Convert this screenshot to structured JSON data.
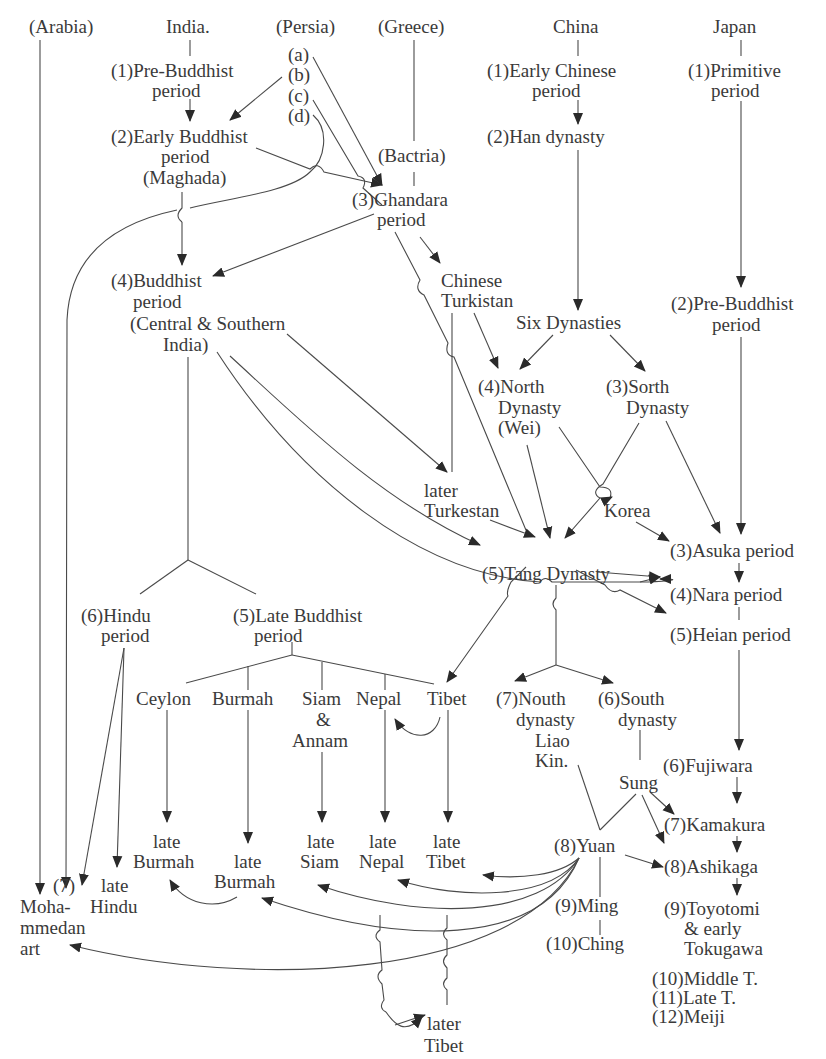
{
  "diagram": {
    "type": "genealogy-flowchart",
    "columns": {
      "arabia": "(Arabia)",
      "india": "India.",
      "persia": "(Persia)",
      "greece": "(Greece)",
      "china": "China",
      "japan": "Japan"
    },
    "persia_sub": [
      "(a)",
      "(b)",
      "(c)",
      "(d)"
    ],
    "bactria": "(Bactria)",
    "india": {
      "p1": [
        "(1)Pre-Buddhist",
        "period"
      ],
      "p2": [
        "(2)Early Buddhist",
        "period",
        "(Maghada)"
      ],
      "p3": [
        "(3)Ghandara",
        "period"
      ],
      "p4": [
        "(4)Buddhist",
        "period",
        "(Central & Southern",
        "India)"
      ],
      "p5": [
        "(5)Late Buddhist",
        "period"
      ],
      "p6": [
        "(6)Hindu",
        "period"
      ],
      "p7": [
        "(7)",
        "Moha-",
        "mmedan",
        "art"
      ],
      "late_hindu": [
        "late",
        "Hindu"
      ],
      "branches": {
        "ceylon": "Ceylon",
        "burmah": "Burmah",
        "siam": [
          "Siam",
          "&",
          "Annam"
        ],
        "nepal": "Nepal",
        "tibet": "Tibet"
      },
      "late_branches": {
        "late_burmah_1": [
          "late",
          "Burmah"
        ],
        "late_burmah_2": [
          "late",
          "Burmah"
        ],
        "late_siam": [
          "late",
          "Siam"
        ],
        "late_nepal": [
          "late",
          "Nepal"
        ],
        "late_tibet": [
          "late",
          "Tibet"
        ],
        "later_tibet": [
          "later",
          "Tibet"
        ]
      }
    },
    "central_asia": {
      "chinese_turkistan": [
        "Chinese",
        "Turkistan"
      ],
      "later_turkestan": [
        "later",
        "Turkestan"
      ],
      "korea": "Korea"
    },
    "china": {
      "p1": [
        "(1)Early Chinese",
        "period"
      ],
      "p2": "(2)Han dynasty",
      "six": "Six Dynasties",
      "north": [
        "(4)North",
        "Dynasty",
        "(Wei)"
      ],
      "sorth": [
        "(3)Sorth",
        "Dynasty"
      ],
      "tang": "(5)Tang Dynasty",
      "nouth": [
        "(7)Nouth",
        "dynasty",
        "Liao",
        "Kin."
      ],
      "south": [
        "(6)South",
        "dynasty"
      ],
      "sung": "Sung",
      "yuan": "(8)Yuan",
      "ming": "(9)Ming",
      "ching": "(10)Ching"
    },
    "japan": {
      "p1": [
        "(1)Primitive",
        "period"
      ],
      "p2": [
        "(2)Pre-Buddhist",
        "period"
      ],
      "p3": "(3)Asuka period",
      "p4": "(4)Nara period",
      "p5": "(5)Heian period",
      "p6": "(6)Fujiwara",
      "p7": "(7)Kamakura",
      "p8": "(8)Ashikaga",
      "p9": [
        "(9)Toyotomi",
        "& early",
        "Tokugawa"
      ],
      "p10": "(10)Middle T.",
      "p11": "(11)Late T.",
      "p12": "(12)Meiji"
    },
    "colors": {
      "background": "#ffffff",
      "text": "#3a3a3a",
      "lines": "#4a4a4a"
    }
  }
}
